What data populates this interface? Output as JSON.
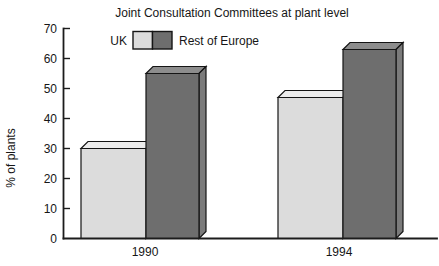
{
  "chart_data": {
    "type": "bar",
    "style": "3d-grouped-bars",
    "title": "Joint Consultation Committees at plant level",
    "categories": [
      "1990",
      "1994"
    ],
    "series": [
      {
        "name": "UK",
        "values": [
          30,
          47
        ],
        "color_front": "#dcdcdc",
        "color_top": "#ededed",
        "color_side": "#c8c8c8"
      },
      {
        "name": "Rest of Europe",
        "values": [
          55,
          63
        ],
        "color_front": "#6e6e6e",
        "color_top": "#8d8d8d",
        "color_side": "#7b7b7b"
      }
    ],
    "xlabel": "",
    "ylabel": "% of plants",
    "ylim": [
      0,
      70
    ],
    "yticks": [
      0,
      10,
      20,
      30,
      40,
      50,
      60,
      70
    ],
    "grid": false,
    "legend_position": "top-left-inside",
    "background": "#ffffff",
    "axis_color": "#1c1c1c"
  }
}
